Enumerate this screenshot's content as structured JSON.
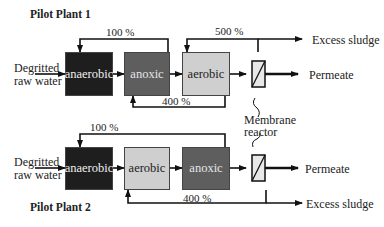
{
  "plant1": {
    "title": "Pilot Plant 1",
    "inlet": [
      "Degritted",
      "raw water"
    ],
    "tanks": [
      "anaerobic",
      "anoxic",
      "aerobic"
    ],
    "recycle_top": "100 %",
    "recycle_sludge": "500 %",
    "recycle_bottom": "400 %",
    "outlets": {
      "excess": "Excess sludge",
      "permeate": "Permeate"
    }
  },
  "plant2": {
    "title": "Pilot Plant 2",
    "inlet": [
      "Degritted",
      "raw water"
    ],
    "tanks": [
      "anaerobic",
      "aerobic",
      "anoxic"
    ],
    "recycle_top": "100 %",
    "recycle_bottom": "400 %",
    "outlets": {
      "excess": "Excess sludge",
      "permeate": "Permeate"
    }
  },
  "membrane_label": [
    "Membrane",
    "reactor"
  ],
  "colors": {
    "anaerobic": "#1e1e1e",
    "anoxic": "#5e5e5e",
    "aerobic": "#cfcfcf",
    "membrane": "#d6d6d6"
  }
}
